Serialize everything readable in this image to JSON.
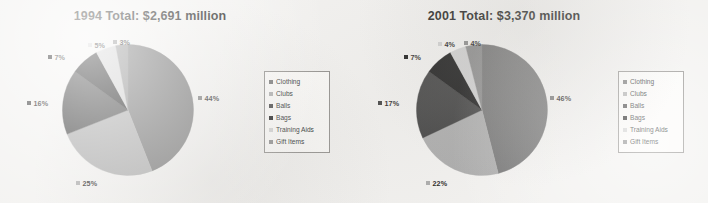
{
  "document": {
    "background_color": "#f2f1ef",
    "text_color": "#231f20"
  },
  "legend_labels": [
    "Clothing",
    "Clubs",
    "Balls",
    "Bags",
    "Training Aids",
    "Gift Items"
  ],
  "series_colors": {
    "Clothing": "#6e6e6e",
    "Clubs": "#a9a9a9",
    "Balls": "#3a3a3a",
    "Bags": "#121212",
    "Training Aids": "#cfcfcf",
    "Gift Items": "#878787"
  },
  "charts": [
    {
      "id": "chart-1994",
      "title": "1994 Total:  $2,691 million",
      "legend": {
        "items": [
          {
            "label": "Clothing",
            "color": "#6e6e6e"
          },
          {
            "label": "Clubs",
            "color": "#a9a9a9"
          },
          {
            "label": "Balls",
            "color": "#3a3a3a"
          },
          {
            "label": "Bags",
            "color": "#121212"
          },
          {
            "label": "Training Aids",
            "color": "#cfcfcf"
          },
          {
            "label": "Gift Items",
            "color": "#878787"
          }
        ]
      },
      "labels": [
        {
          "text": "44%",
          "color": "#6e6e6e",
          "left": 198,
          "top": 95
        },
        {
          "text": "25%",
          "color": "#a9a9a9",
          "left": 76,
          "top": 180
        },
        {
          "text": "16%",
          "color": "#3a3a3a",
          "left": 27,
          "top": 100
        },
        {
          "text": "7%",
          "color": "#121212",
          "left": 48,
          "top": 54
        },
        {
          "text": "5%",
          "color": "#cfcfcf",
          "left": 88,
          "top": 42
        },
        {
          "text": "3%",
          "color": "#878787",
          "left": 113,
          "top": 39
        }
      ]
    },
    {
      "id": "chart-2001",
      "title": "2001 Total:  $3,370 million",
      "legend": {
        "items": [
          {
            "label": "Clothing",
            "color": "#6e6e6e"
          },
          {
            "label": "Clubs",
            "color": "#a9a9a9"
          },
          {
            "label": "Balls",
            "color": "#3a3a3a"
          },
          {
            "label": "Bags",
            "color": "#121212"
          },
          {
            "label": "Training Aids",
            "color": "#cfcfcf"
          },
          {
            "label": "Gift Items",
            "color": "#878787"
          }
        ]
      },
      "labels": [
        {
          "text": "46%",
          "color": "#6e6e6e",
          "left": 196,
          "top": 95
        },
        {
          "text": "22%",
          "color": "#a9a9a9",
          "left": 72,
          "top": 180
        },
        {
          "text": "17%",
          "color": "#3a3a3a",
          "left": 24,
          "top": 100
        },
        {
          "text": "7%",
          "color": "#121212",
          "left": 50,
          "top": 54
        },
        {
          "text": "4%",
          "color": "#cfcfcf",
          "left": 84,
          "top": 41
        },
        {
          "text": "4%",
          "color": "#878787",
          "left": 110,
          "top": 40
        }
      ]
    }
  ],
  "chart_data": [
    {
      "type": "pie",
      "title": "1994 Total:  $2,691 million",
      "total_label": "$2,691 million",
      "year": "1994",
      "categories": [
        "Clothing",
        "Clubs",
        "Balls",
        "Bags",
        "Training Aids",
        "Gift Items"
      ],
      "values": [
        44,
        25,
        16,
        7,
        5,
        3
      ],
      "value_unit": "percent",
      "data_labels": [
        "44%",
        "25%",
        "16%",
        "7%",
        "5%",
        "3%"
      ],
      "colors": [
        "#6e6e6e",
        "#a9a9a9",
        "#3a3a3a",
        "#121212",
        "#cfcfcf",
        "#878787"
      ],
      "legend_position": "right",
      "start_angle_deg": 0,
      "direction": "clockwise",
      "grid": false
    },
    {
      "type": "pie",
      "title": "2001 Total:  $3,370 million",
      "total_label": "$3,370 million",
      "year": "2001",
      "categories": [
        "Clothing",
        "Clubs",
        "Balls",
        "Bags",
        "Training Aids",
        "Gift Items"
      ],
      "values": [
        46,
        22,
        17,
        7,
        4,
        4
      ],
      "value_unit": "percent",
      "data_labels": [
        "46%",
        "22%",
        "17%",
        "7%",
        "4%",
        "4%"
      ],
      "colors": [
        "#6e6e6e",
        "#a9a9a9",
        "#3a3a3a",
        "#121212",
        "#cfcfcf",
        "#878787"
      ],
      "legend_position": "right",
      "start_angle_deg": 0,
      "direction": "clockwise",
      "grid": false
    }
  ]
}
